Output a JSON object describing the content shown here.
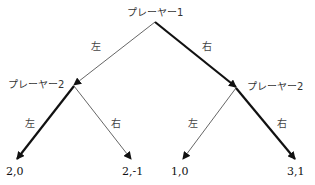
{
  "tree": {
    "root": {
      "label": "プレーヤー1"
    },
    "p2_left": {
      "label": "プレーヤー2"
    },
    "p2_right": {
      "label": "プレーヤー2"
    },
    "edges": {
      "root_left": {
        "label": "左",
        "bold": false
      },
      "root_right": {
        "label": "右",
        "bold": true
      },
      "left_left": {
        "label": "左",
        "bold": true
      },
      "left_right": {
        "label": "右",
        "bold": false
      },
      "right_left": {
        "label": "左",
        "bold": false
      },
      "right_right": {
        "label": "右",
        "bold": true
      }
    },
    "payoffs": [
      "2,0",
      "2,-1",
      "1,0",
      "3,1"
    ]
  },
  "colors": {
    "line": "#111111",
    "thin_line": "#555555"
  }
}
